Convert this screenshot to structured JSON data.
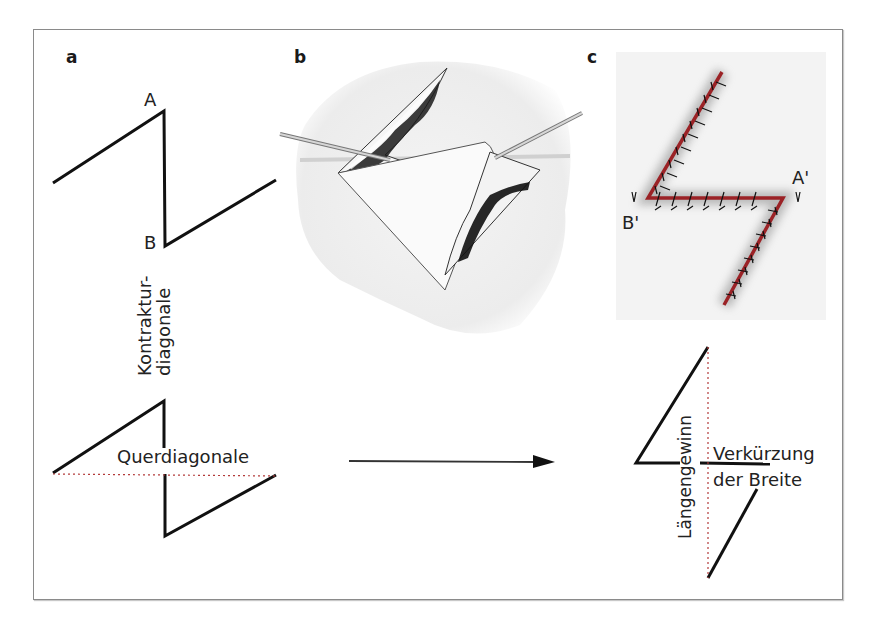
{
  "figure": {
    "panels": [
      {
        "id": "a",
        "label": "a"
      },
      {
        "id": "b",
        "label": "b"
      },
      {
        "id": "c",
        "label": "c"
      }
    ],
    "panel_a": {
      "point_top": "A",
      "point_bottom": "B",
      "contracture_label_line1": "Kontraktur-",
      "contracture_label_line2": "diagonale",
      "cross_diagonal_label": "Querdiagonale"
    },
    "panel_b": {
      "description": "Surgical illustration: Z-plasty incisions with triangular flaps lifted by two hooks"
    },
    "panel_c": {
      "point_right": "A'",
      "point_left": "B'",
      "description": "Sutured Z-plasty with transposed flaps (red suture line)",
      "length_gain_label": "Längengewinn",
      "width_shortening_line1": "Verkürzung",
      "width_shortening_line2": "der Breite"
    },
    "colors": {
      "line": "#111111",
      "dotted_diagonal": "#b33a3a",
      "suture_line": "#9b2226",
      "frame": "#8a8a8a"
    }
  }
}
